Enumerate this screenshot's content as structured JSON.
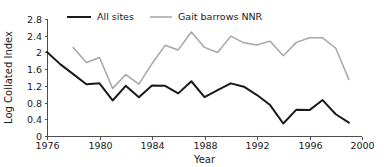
{
  "chart_data": {
    "type": "line",
    "title": "",
    "xlabel": "Year",
    "ylabel": "Log Collated Index",
    "xlim": [
      1976,
      2000
    ],
    "ylim": [
      0,
      2.8
    ],
    "grid": false,
    "legend_position": "top",
    "x_ticks": [
      "1976",
      "1980",
      "1984",
      "1988",
      "1992",
      "1996",
      "2000"
    ],
    "x_tick_values": [
      1976,
      1980,
      1984,
      1988,
      1992,
      1996,
      2000
    ],
    "y_ticks": [
      "0",
      "0.4",
      "0.8",
      "1.2",
      "1.6",
      "2",
      "2.4",
      "2.8"
    ],
    "y_tick_values": [
      0,
      0.4,
      0.8,
      1.2,
      1.6,
      2.0,
      2.4,
      2.8
    ],
    "series": [
      {
        "name": "All sites",
        "color": "#1a1a1a",
        "width": 2.0,
        "x": [
          1976,
          1977,
          1978,
          1979,
          1980,
          1981,
          1982,
          1983,
          1984,
          1985,
          1986,
          1987,
          1988,
          1989,
          1990,
          1991,
          1992,
          1993,
          1994,
          1995,
          1996,
          1997,
          1998,
          1999
        ],
        "values": [
          2.01,
          1.72,
          1.48,
          1.24,
          1.26,
          0.85,
          1.2,
          0.93,
          1.21,
          1.2,
          1.02,
          1.31,
          0.93,
          1.1,
          1.26,
          1.18,
          0.98,
          0.74,
          0.3,
          0.63,
          0.62,
          0.86,
          0.52,
          0.32
        ]
      },
      {
        "name": "Gait barrows NNR",
        "color": "#a6a6a6",
        "width": 1.5,
        "x": [
          1978,
          1979,
          1980,
          1981,
          1982,
          1983,
          1984,
          1985,
          1986,
          1987,
          1988,
          1989,
          1990,
          1991,
          1992,
          1993,
          1994,
          1995,
          1996,
          1997,
          1998,
          1999
        ],
        "values": [
          2.12,
          1.76,
          1.88,
          1.14,
          1.47,
          1.24,
          1.73,
          2.17,
          2.06,
          2.49,
          2.12,
          2.0,
          2.39,
          2.23,
          2.18,
          2.27,
          1.92,
          2.24,
          2.35,
          2.35,
          2.1,
          1.35
        ]
      }
    ]
  },
  "legend": {
    "entries": [
      {
        "label": "All sites"
      },
      {
        "label": "Gait barrows NNR"
      }
    ]
  }
}
